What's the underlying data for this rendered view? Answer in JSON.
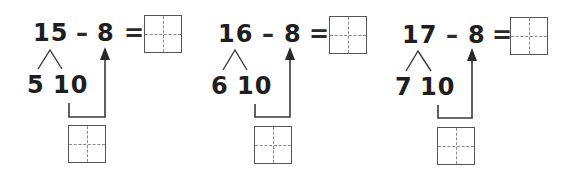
{
  "worksheet": {
    "problems": [
      {
        "minuend": "15",
        "operator": "–",
        "subtrahend": "8",
        "equals": "=",
        "split_ones": "5",
        "split_ten": "10",
        "answer_box": "",
        "intermediate_box": ""
      },
      {
        "minuend": "16",
        "operator": "–",
        "subtrahend": "8",
        "equals": "=",
        "split_ones": "6",
        "split_ten": "10",
        "answer_box": "",
        "intermediate_box": ""
      },
      {
        "minuend": "17",
        "operator": "–",
        "subtrahend": "8",
        "equals": "=",
        "split_ones": "7",
        "split_ten": "10",
        "answer_box": "",
        "intermediate_box": ""
      }
    ],
    "icons": {
      "split_lines": "decomposition-branch-icon",
      "arrow": "arrow-up-icon"
    },
    "colors": {
      "text": "#1e1e1e",
      "lines": "#3a3a3a",
      "box_border": "#555555",
      "box_dash": "#8a8a8a"
    }
  }
}
